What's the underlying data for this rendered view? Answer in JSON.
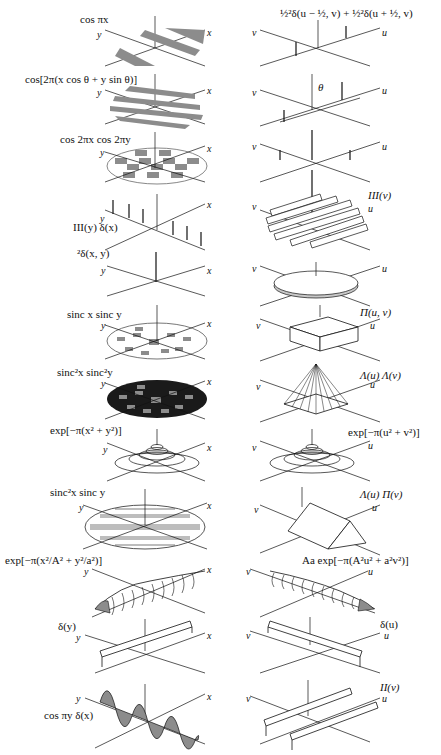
{
  "figure": {
    "axes": {
      "left": [
        "x",
        "y"
      ],
      "right": [
        "u",
        "v"
      ]
    },
    "pairs": [
      {
        "left": "cos πx",
        "right": "½²δ(u − ½, v) + ½²δ(u + ½, v)"
      },
      {
        "left": "cos[2π(x cos θ + y sin θ)]",
        "right": "",
        "right_annotation": "θ"
      },
      {
        "left": "cos 2πx cos 2πy",
        "right": ""
      },
      {
        "left": "III(y) δ(x)",
        "right": "III(v)"
      },
      {
        "left": "²δ(x, y)",
        "right": ""
      },
      {
        "left": "sinc x sinc y",
        "right": "Π(u, v)"
      },
      {
        "left": "sinc²x sinc²y",
        "right": "Λ(u) Λ(v)"
      },
      {
        "left": "exp[−π(x² + y²)]",
        "right": "exp[−π(u² + v²)]"
      },
      {
        "left": "sinc²x sinc y",
        "right": "Λ(u) Π(v)"
      },
      {
        "left": "exp[−π(x²/A² + y²/a²)]",
        "right": "Aa exp[−π(A²u² + a²v²)]"
      },
      {
        "left": "δ(y)",
        "right": "δ(u)"
      },
      {
        "left": "cos πy δ(x)",
        "right": "II(v)"
      }
    ]
  },
  "colors": {
    "ink": "#111111",
    "shade": "#8c8c8c",
    "dark": "#1a1a1a",
    "paper": "#ffffff"
  }
}
